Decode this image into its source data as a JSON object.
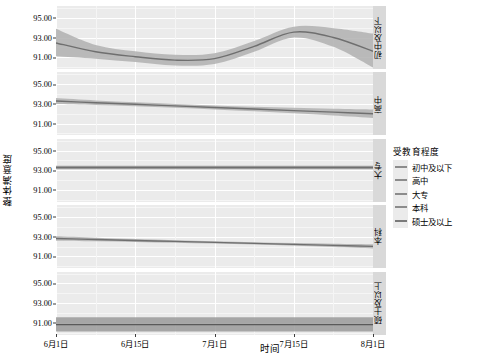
{
  "chart_data": {
    "type": "line",
    "title": "",
    "xlabel": "时间",
    "ylabel": "整体满意度",
    "ylim": [
      89.8,
      96.2
    ],
    "yticks": [
      95.0,
      93.0,
      91.0
    ],
    "ytick_labels": [
      "95.00",
      "93.00",
      "91.00"
    ],
    "xtick_labels": [
      "6月1日",
      "6月15日",
      "7月1日",
      "7月15日",
      "8月1日"
    ],
    "x": [
      0,
      0.125,
      0.25,
      0.375,
      0.5,
      0.625,
      0.75,
      0.875,
      1.0
    ],
    "grid": true,
    "legend_position": "right",
    "facet_variable": "受教育程度",
    "band_type": "confidence-interval",
    "series": [
      {
        "name": "初中及以下",
        "facet_label": "初中及以下",
        "color": "#6f6f6f",
        "band_color": "#b0b0b0",
        "values": [
          92.45,
          91.55,
          91.05,
          90.7,
          90.85,
          92.1,
          93.55,
          93.0,
          91.6
        ],
        "band_lower": [
          91.1,
          90.85,
          90.5,
          90.15,
          90.3,
          91.55,
          93.0,
          92.05,
          89.95
        ],
        "band_upper": [
          93.9,
          92.25,
          91.6,
          91.25,
          91.4,
          92.65,
          94.1,
          93.95,
          93.4
        ]
      },
      {
        "name": "高中",
        "facet_label": "高中",
        "color": "#6f6f6f",
        "band_color": "#b0b0b0",
        "values": [
          93.25,
          93.08,
          92.92,
          92.76,
          92.6,
          92.44,
          92.28,
          92.12,
          91.96
        ],
        "band_lower": [
          92.95,
          92.85,
          92.72,
          92.57,
          92.4,
          92.21,
          92.0,
          91.77,
          91.52
        ],
        "band_upper": [
          93.55,
          93.31,
          93.12,
          92.95,
          92.8,
          92.67,
          92.56,
          92.47,
          92.4
        ]
      },
      {
        "name": "大专",
        "facet_label": "大专",
        "color": "#6f6f6f",
        "band_color": "#9a9a9a",
        "values": [
          93.3,
          93.3,
          93.3,
          93.3,
          93.3,
          93.3,
          93.3,
          93.3,
          93.3
        ],
        "band_lower": [
          93.12,
          93.12,
          93.12,
          93.12,
          93.12,
          93.12,
          93.12,
          93.12,
          93.12
        ],
        "band_upper": [
          93.48,
          93.48,
          93.48,
          93.48,
          93.48,
          93.48,
          93.48,
          93.48,
          93.48
        ]
      },
      {
        "name": "本科",
        "facet_label": "本科",
        "color": "#6f6f6f",
        "band_color": "#b0b0b0",
        "values": [
          92.8,
          92.7,
          92.6,
          92.5,
          92.4,
          92.3,
          92.2,
          92.1,
          92.0
        ],
        "band_lower": [
          92.58,
          92.52,
          92.45,
          92.37,
          92.28,
          92.18,
          92.06,
          91.93,
          91.78
        ],
        "band_upper": [
          93.02,
          92.88,
          92.75,
          92.63,
          92.52,
          92.42,
          92.34,
          92.27,
          92.22
        ]
      },
      {
        "name": "硕士及以上",
        "facet_label": "硕士及以上",
        "color": "#5a5a5a",
        "band_color": "#9a9a9a",
        "values": [
          90.85,
          90.85,
          90.85,
          90.85,
          90.85,
          90.85,
          90.85,
          90.85,
          90.85
        ],
        "band_lower": [
          90.15,
          90.15,
          90.15,
          90.15,
          90.15,
          90.15,
          90.15,
          90.15,
          90.15
        ],
        "band_upper": [
          91.6,
          91.6,
          91.6,
          91.6,
          91.6,
          91.6,
          91.6,
          91.6,
          91.6
        ]
      }
    ]
  },
  "legend": {
    "title": "受教育程度",
    "items": [
      {
        "label": "初中及以下",
        "color": "#8c8c8c"
      },
      {
        "label": "高中",
        "color": "#8c8c8c"
      },
      {
        "label": "大专",
        "color": "#8c8c8c"
      },
      {
        "label": "本科",
        "color": "#8c8c8c"
      },
      {
        "label": "硕士及以上",
        "color": "#7a7a7a"
      }
    ]
  },
  "axes": {
    "x_title": "时间",
    "y_title": "整体满意度"
  }
}
